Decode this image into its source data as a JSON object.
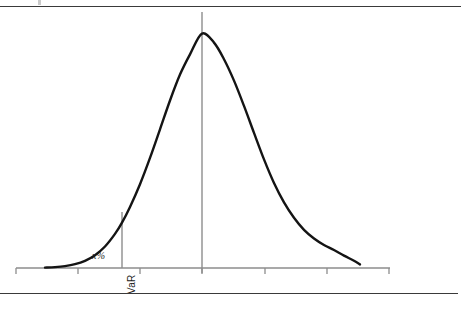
{
  "figure": {
    "background_color": "#ffffff",
    "width": 464,
    "height": 309,
    "top_rule_label": "top-horizontal-rule",
    "bottom_rule_label": "bottom-horizontal-rule",
    "speck_label": "scan-speck-artifact",
    "ghost_text": "",
    "ghost_text_2": ""
  },
  "annotations": {
    "tail_probability_label": "x%",
    "var_label": "VaR"
  },
  "colors": {
    "curve": "#141414",
    "axis": "#8d8d8d",
    "center_line": "#8d8d8d",
    "var_line": "#8d8d8d",
    "rule": "#3a3a3a",
    "text": "#1b1b1b"
  },
  "chart_data": {
    "type": "line",
    "title": "",
    "subtitle": "",
    "xlabel": "",
    "ylabel": "",
    "grid": false,
    "legend": null,
    "distribution": {
      "family": "normal",
      "mean_px": 202,
      "peak_y_px": 33,
      "baseline_y_px": 268,
      "std_dev_px": 52
    },
    "axis": {
      "y_px": 268,
      "x_start_px": 16,
      "x_end_px": 390,
      "tick_positions_px": [
        16,
        78,
        140,
        202,
        265,
        327,
        389
      ],
      "tick_labels": [
        "",
        "",
        "",
        "",
        "",
        "",
        ""
      ],
      "tick_length_px": 6,
      "tick_direction": "down"
    },
    "center_line": {
      "name": "mean-line",
      "x_px": 202,
      "y_top_px": 12,
      "y_bottom_px": 273
    },
    "var_line": {
      "name": "var-cutoff-line",
      "x_px": 122,
      "y_top_px": 212,
      "y_bottom_px": 268,
      "label": "VaR"
    },
    "tail_region": {
      "label": "x%",
      "side": "left",
      "x_from_px": 16,
      "x_to_px": 122
    },
    "curve_extent": {
      "visible_left_px": 45,
      "visible_right_px": 360
    },
    "x": [
      45,
      55,
      65,
      75,
      85,
      95,
      105,
      115,
      122,
      130,
      140,
      150,
      160,
      170,
      180,
      190,
      202,
      214,
      224,
      234,
      244,
      254,
      264,
      274,
      284,
      294,
      304,
      314,
      324,
      334,
      344,
      354,
      360
    ],
    "y": [
      267.6,
      267.1,
      266.1,
      264.2,
      260.8,
      255.2,
      246.5,
      233.9,
      222.6,
      206.9,
      184.2,
      157.9,
      129.3,
      100.5,
      74.6,
      54.4,
      33.6,
      42.6,
      59.2,
      80.6,
      105.9,
      132.9,
      159.4,
      183.0,
      202.4,
      217.8,
      229.9,
      238.5,
      245.0,
      250.0,
      255.6,
      260.8,
      264.4
    ]
  }
}
